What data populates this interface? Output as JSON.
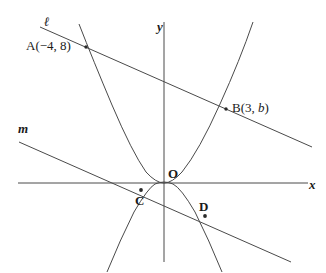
{
  "figure": {
    "stroke_color": "#3a3a3a",
    "label_color": "#1a1a1a",
    "background": "#ffffff",
    "axes": {
      "x_label": "x",
      "y_label": "y",
      "origin_label": "O"
    },
    "lines": [
      {
        "name": "line-l",
        "label": "ℓ"
      },
      {
        "name": "line-m",
        "label": "m"
      }
    ],
    "points": [
      {
        "name": "point-a",
        "label": "A",
        "coords": "(−4, 8)",
        "full": "A(−4, 8)"
      },
      {
        "name": "point-b",
        "label": "B",
        "coords": "(3, b)",
        "full": "B(3, b)"
      },
      {
        "name": "point-c",
        "label": "C"
      },
      {
        "name": "point-d",
        "label": "D"
      },
      {
        "name": "point-o",
        "label": "O"
      }
    ]
  },
  "chart_data": {
    "type": "line",
    "title": "",
    "xlabel": "x",
    "ylabel": "y",
    "grid": false,
    "legend": "none",
    "xlim": [
      -7.5,
      8.5
    ],
    "ylim": [
      -6.5,
      11.5
    ],
    "series": [
      {
        "name": "upward-parabola",
        "note": "vertex at origin, opens upward, passes through A(-4,8) and B(3,b)",
        "x": [
          -4.3,
          -3.5,
          -3.0,
          -2.5,
          -2.0,
          -1.5,
          -1.0,
          -0.5,
          0,
          0.5,
          1.0,
          1.5,
          2.0,
          2.5,
          3.0,
          3.5,
          3.9
        ],
        "y": [
          9.2,
          6.1,
          4.5,
          3.1,
          2.0,
          1.1,
          0.5,
          0.1,
          0,
          0.1,
          0.5,
          1.1,
          2.0,
          3.1,
          4.5,
          6.1,
          7.6
        ]
      },
      {
        "name": "downward-parabola",
        "note": "vertex at origin, opens downward, passes through C and D",
        "x": [
          -2.6,
          -2.2,
          -1.8,
          -1.4,
          -1.0,
          -0.6,
          -0.2,
          0,
          0.2,
          0.6,
          1.0,
          1.4,
          1.8,
          2.2,
          2.6
        ],
        "y": [
          -6.2,
          -4.4,
          -3.0,
          -1.8,
          -0.9,
          -0.3,
          -0.04,
          0,
          -0.04,
          -0.3,
          -0.9,
          -1.8,
          -3.0,
          -4.4,
          -6.2
        ]
      },
      {
        "name": "line-l",
        "note": "straight line through A(-4,8) and B(3,b)",
        "x": [
          -6.0,
          7.2
        ],
        "y": [
          9.6,
          4.0
        ]
      },
      {
        "name": "line-m",
        "note": "straight line through C and D, parallel to line l",
        "x": [
          -7.0,
          6.2
        ],
        "y": [
          2.0,
          -3.6
        ]
      }
    ],
    "points": [
      {
        "label": "A(−4, 8)",
        "x": -4,
        "y": 8
      },
      {
        "label": "B(3, b)",
        "x": 3,
        "y": 4.6
      },
      {
        "label": "C",
        "x": -1.0,
        "y": -0.35
      },
      {
        "label": "D",
        "x": 1.75,
        "y": -1.6
      },
      {
        "label": "O",
        "x": 0,
        "y": 0
      }
    ]
  }
}
